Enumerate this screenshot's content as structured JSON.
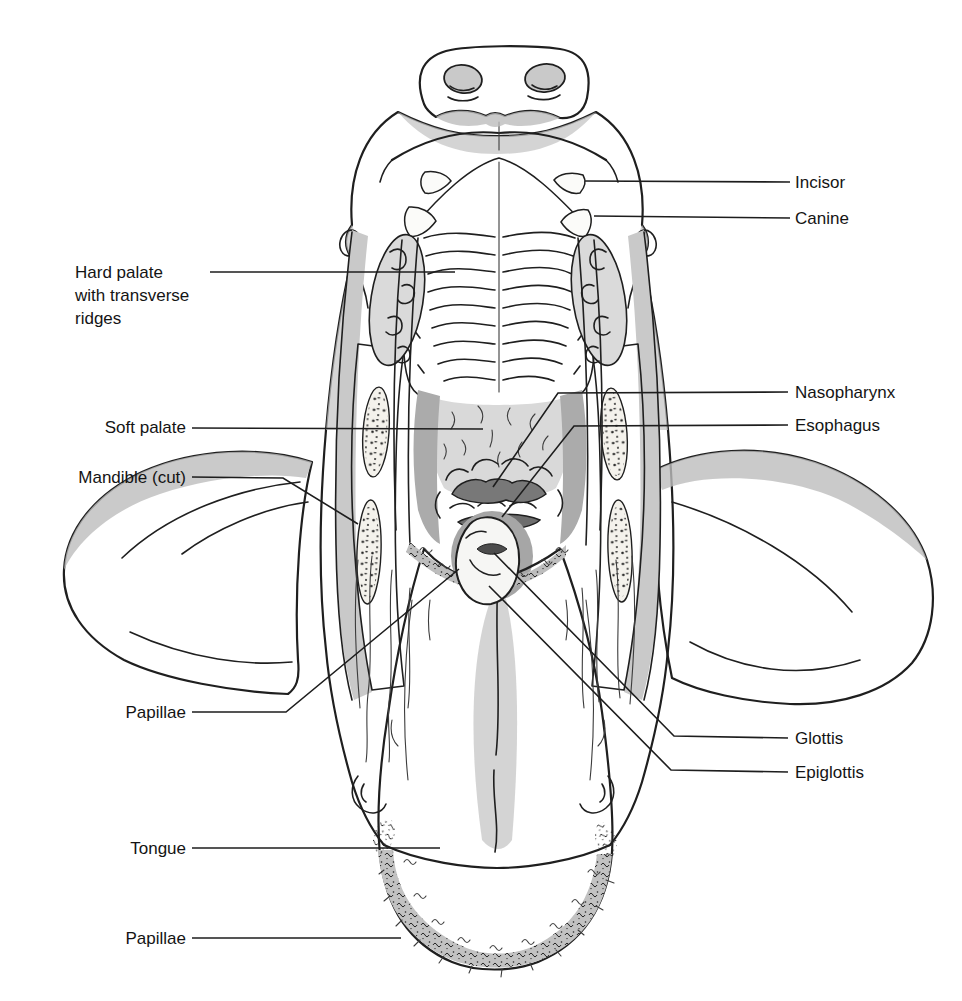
{
  "labels": {
    "incisor": "Incisor",
    "canine": "Canine",
    "hard_palate": "Hard palate\nwith transverse\nridges",
    "soft_palate": "Soft palate",
    "mandible_cut": "Mandible (cut)",
    "nasopharynx": "Nasopharynx",
    "esophagus": "Esophagus",
    "papillae_mid": "Papillae",
    "glottis": "Glottis",
    "epiglottis": "Epiglottis",
    "tongue": "Tongue",
    "papillae_tip": "Papillae"
  },
  "colors": {
    "background": "#ffffff",
    "ink": "#1f1f1f",
    "tissue_light": "#d7d7d7",
    "palate": "#dcdcdc",
    "band_dark": "#a2a2a2",
    "flap": "#cfcfcf",
    "bone_white": "#f4f2ec",
    "opening_dark": "#6d6d6d",
    "epiglottis_white": "#f6f6f4",
    "tongue": "#cbcbcb"
  }
}
